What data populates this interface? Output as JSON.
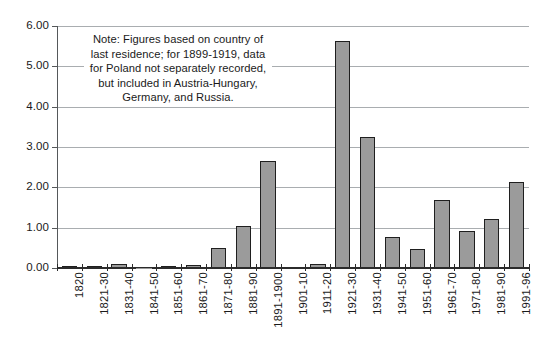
{
  "chart_data": {
    "type": "bar",
    "title": "",
    "subtitle": "",
    "xlabel": "",
    "ylabel": "",
    "ylim": [
      0.0,
      6.0
    ],
    "ytick_step": 1.0,
    "ytick_labels": [
      "6.00",
      "5.00",
      "4.00",
      "3.00",
      "2.00",
      "1.00",
      "0.00"
    ],
    "ytick_values": [
      6.0,
      5.0,
      4.0,
      3.0,
      2.0,
      1.0,
      0.0
    ],
    "grid": true,
    "legend": false,
    "categories": [
      "1820",
      "1821-30",
      "1831-40",
      "1841-50",
      "1851-60",
      "1861-70",
      "1871-80",
      "1881-90",
      "1891-1900",
      "1901-10",
      "1911-20",
      "1921-30",
      "1931-40",
      "1941-50",
      "1951-60",
      "1961-70",
      "1971-80",
      "1981-90",
      "1991-96"
    ],
    "values": [
      0.05,
      0.02,
      0.09,
      0.01,
      0.06,
      0.08,
      0.5,
      1.03,
      2.66,
      0.0,
      0.1,
      5.62,
      3.25,
      0.78,
      0.46,
      1.69,
      0.91,
      1.22,
      2.13
    ],
    "bar_fill_color": "#9b9b9b",
    "bar_edge_color": "#1f1f1f",
    "gridline_color": "#a9adb0",
    "axis_color": "#2b2b2b",
    "background_color": "#ffffff"
  },
  "annotation": {
    "note_text": "Note: Figures based on country of last residence; for 1899-1919, data for Poland not separately recorded, but included in Austria-Hungary, Germany, and Russia."
  }
}
